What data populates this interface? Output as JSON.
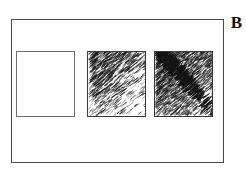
{
  "figure": {
    "panel_label": "B",
    "background_color": "#ffffff",
    "frame": {
      "name": "panel-border",
      "stroke_color": "#4a4a4a",
      "x": 11,
      "y": 19,
      "width": 213,
      "height": 144
    },
    "tiles": [
      {
        "id": "tile-1",
        "label": "",
        "description": "blank white square",
        "texture": "none",
        "density": 0,
        "border_color": "#6e6e6e",
        "x": 16,
        "y": 51,
        "width": 59,
        "height": 66
      },
      {
        "id": "tile-2",
        "label": "",
        "description": "diagonal dash texture, dense upper-left fading to sparse lower-right",
        "texture": "diagonal-dashes",
        "density": 55,
        "border_color": "#3a3a3a",
        "x": 87,
        "y": 51,
        "width": 59,
        "height": 66
      },
      {
        "id": "tile-3",
        "label": "",
        "description": "dense diagonal speckle texture with dark diagonal band",
        "texture": "diagonal-dense-speckle",
        "density": 85,
        "border_color": "#3a3a3a",
        "x": 154,
        "y": 51,
        "width": 59,
        "height": 66
      }
    ]
  },
  "chart_data": {
    "type": "heatmap",
    "title": "",
    "panel": "B",
    "xlabel": "",
    "ylabel": "",
    "grid": false,
    "legend": "none",
    "categories": [
      "tile-1",
      "tile-2",
      "tile-3"
    ],
    "series": [
      {
        "name": "texture density",
        "values": [
          0,
          55,
          85
        ]
      }
    ],
    "annotations": [
      "B"
    ]
  }
}
